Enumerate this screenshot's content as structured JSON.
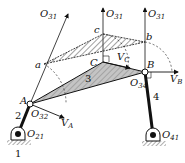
{
  "diagram": {
    "colors": {
      "ink": "#111111",
      "shade": "#bdbdbd",
      "hatch": "#444444"
    },
    "points": {
      "A": {
        "main": "A",
        "sub": ""
      },
      "B": {
        "main": "B",
        "sub": ""
      },
      "C": {
        "main": "C",
        "sub": ""
      },
      "a": {
        "main": "a",
        "sub": ""
      },
      "b": {
        "main": "b",
        "sub": ""
      },
      "c": {
        "main": "c",
        "sub": ""
      },
      "O21": {
        "main": "O",
        "sub": "21"
      },
      "O32": {
        "main": "O",
        "sub": "32"
      },
      "O34": {
        "main": "O",
        "sub": "34"
      },
      "O41": {
        "main": "O",
        "sub": "41"
      },
      "O31_left": {
        "main": "O",
        "sub": "31"
      },
      "O31_mid": {
        "main": "O",
        "sub": "31"
      },
      "O31_right": {
        "main": "O",
        "sub": "31"
      }
    },
    "velocities": {
      "VA": {
        "main": "V",
        "sub": "A"
      },
      "VB": {
        "main": "V",
        "sub": "B"
      },
      "VC": {
        "main": "V",
        "sub": "C"
      }
    },
    "links": {
      "ground": "1",
      "crank": "2",
      "coupler": "3",
      "rocker": "4"
    }
  }
}
